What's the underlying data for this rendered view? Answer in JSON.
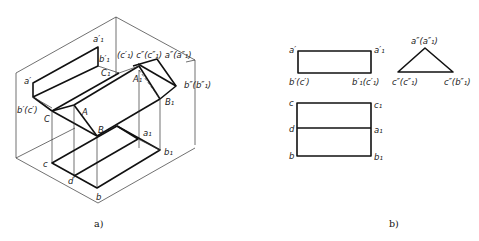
{
  "figure_a": {
    "caption": "a)",
    "labels": {
      "a1_prime": "a′₁",
      "c1_prime_group": "(c′₁) c″(c″₁) a″(a″₁)",
      "b1_prime": "b′₁",
      "C1": "C₁",
      "a_prime": "a′",
      "A1": "A₁",
      "b_dprime": "b″(b″₁)",
      "b_prime_c": "b′(c′)",
      "C": "C",
      "A": "A",
      "B1": "B₁",
      "B": "B",
      "a1": "a₁",
      "b1": "b₁",
      "c": "c",
      "d": "d",
      "b": "b"
    }
  },
  "figure_b": {
    "caption": "b)",
    "front_view": {
      "a_prime": "a′",
      "a1_prime": "a′₁",
      "b_prime_c": "b′(c′)",
      "b1_prime_c1": "b′₁(c′₁)"
    },
    "side_view": {
      "apex": "a″(a″₁)",
      "left": "c″(c″₁)",
      "right": "c″(b″₁)"
    },
    "top_view": {
      "c": "c",
      "c1": "c₁",
      "d": "d",
      "a1": "a₁",
      "b": "b",
      "b1": "b₁"
    }
  }
}
